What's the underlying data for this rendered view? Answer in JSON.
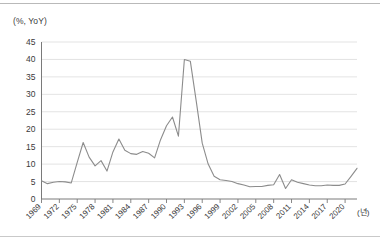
{
  "figure": {
    "y_axis_unit_label": "(%, YoY)",
    "x_axis_unit_label": "(년)"
  },
  "chart_data": {
    "type": "line",
    "title": "",
    "subtitle": "",
    "xlabel": "(년)",
    "ylabel": "(%, YoY)",
    "ylim": [
      0,
      45
    ],
    "ytick_step": 5,
    "yticks": [
      0,
      5,
      10,
      15,
      20,
      25,
      30,
      35,
      40,
      45
    ],
    "ytick_labels": [
      "0",
      "5",
      "10",
      "15",
      "20",
      "25",
      "30",
      "35",
      "40",
      "45"
    ],
    "xlim": [
      1969,
      2022
    ],
    "xtick_step": 3,
    "xticks": [
      1969,
      1972,
      1975,
      1978,
      1981,
      1984,
      1987,
      1990,
      1993,
      1996,
      1999,
      2002,
      2005,
      2008,
      2011,
      2014,
      2017,
      2020
    ],
    "xtick_labels": [
      "1969",
      "1972",
      "1975",
      "1978",
      "1981",
      "1984",
      "1987",
      "1990",
      "1993",
      "1996",
      "1999",
      "2002",
      "2005",
      "2008",
      "2011",
      "2014",
      "2017",
      "2020"
    ],
    "grid": "horizontal",
    "legend": "none",
    "line_color": "#8c8c8c",
    "grid_color": "#dcdcdc",
    "axis_color": "#7a7a7a",
    "series": [
      {
        "name": "YoY growth",
        "x": [
          1969,
          1970,
          1971,
          1972,
          1973,
          1974,
          1975,
          1976,
          1977,
          1978,
          1979,
          1980,
          1981,
          1982,
          1983,
          1984,
          1985,
          1986,
          1987,
          1988,
          1989,
          1990,
          1991,
          1992,
          1993,
          1994,
          1995,
          1996,
          1997,
          1998,
          1999,
          2000,
          2001,
          2002,
          2003,
          2004,
          2005,
          2006,
          2007,
          2008,
          2009,
          2010,
          2011,
          2012,
          2013,
          2014,
          2015,
          2016,
          2017,
          2018,
          2019,
          2020,
          2021,
          2022
        ],
        "values": [
          5.2,
          4.4,
          4.8,
          5.0,
          4.9,
          4.6,
          10.5,
          16.2,
          12.0,
          9.5,
          11.0,
          8.0,
          13.5,
          17.2,
          14.0,
          13.0,
          12.8,
          13.6,
          13.1,
          11.8,
          17.0,
          21.0,
          23.5,
          18.0,
          40.0,
          39.5,
          28.0,
          16.0,
          10.0,
          6.5,
          5.5,
          5.3,
          5.0,
          4.4,
          4.0,
          3.5,
          3.6,
          3.6,
          3.9,
          4.1,
          7.0,
          3.0,
          5.5,
          4.8,
          4.4,
          4.0,
          3.8,
          3.8,
          4.0,
          3.9,
          3.9,
          4.3,
          6.5,
          8.8
        ]
      }
    ]
  }
}
